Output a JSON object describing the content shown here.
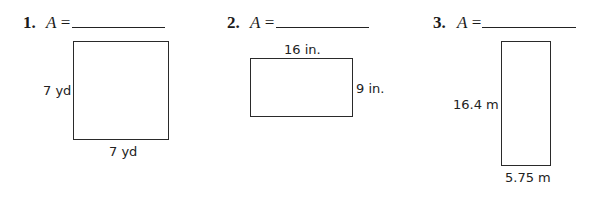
{
  "problems": [
    {
      "number": "1.",
      "area_label": "A",
      "equals": "=",
      "answer": "",
      "shape": "square",
      "dimensions": {
        "side_left": "7 yd",
        "bottom": "7 yd"
      }
    },
    {
      "number": "2.",
      "area_label": "A",
      "equals": "=",
      "answer": "",
      "shape": "rectangle",
      "dimensions": {
        "top": "16 in.",
        "side_right": "9 in."
      }
    },
    {
      "number": "3.",
      "area_label": "A",
      "equals": "=",
      "answer": "",
      "shape": "rectangle",
      "dimensions": {
        "side_left": "16.4 m",
        "bottom": "5.75 m"
      }
    }
  ]
}
